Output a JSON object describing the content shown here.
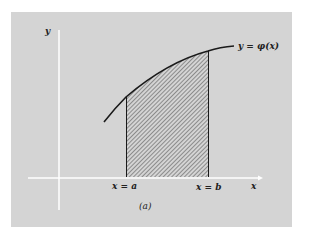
{
  "figure": {
    "y_axis_label": "y",
    "x_axis_label": "x",
    "curve_label": "y = φ(x)",
    "lower_limit_label": "x = a",
    "upper_limit_label": "x = b",
    "caption": "(a)"
  },
  "colors": {
    "panel": "#d4d4d4",
    "axes": "#ffffff",
    "curve": "#1a1a1a",
    "hatch": "#444444"
  }
}
